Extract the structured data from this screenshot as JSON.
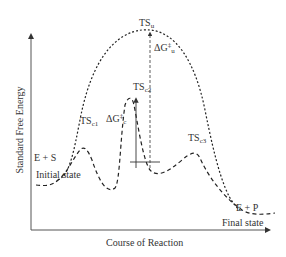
{
  "diagram": {
    "type": "reaction-energy-profile",
    "y_axis_label": "Standard Free Energy",
    "x_axis_label": "Course of Reaction",
    "initial": {
      "species": "E + S",
      "state_label": "Initial state"
    },
    "final": {
      "species": "E + P",
      "state_label": "Final state"
    },
    "uncatalyzed": {
      "ts_main": "TS",
      "ts_sub": "u",
      "dg_main": "ΔG",
      "dg_sup": "‡",
      "dg_sub": "u"
    },
    "catalyzed": {
      "ts1_main": "TS",
      "ts1_sub": "c1",
      "ts2_main": "TS",
      "ts2_sub": "c2",
      "ts3_main": "TS",
      "ts3_sub": "c3",
      "dg_main": "ΔG",
      "dg_sup": "‡",
      "dg_sub": "c"
    },
    "colors": {
      "curve": "#222222",
      "axis": "#555555",
      "text": "#333333"
    }
  }
}
